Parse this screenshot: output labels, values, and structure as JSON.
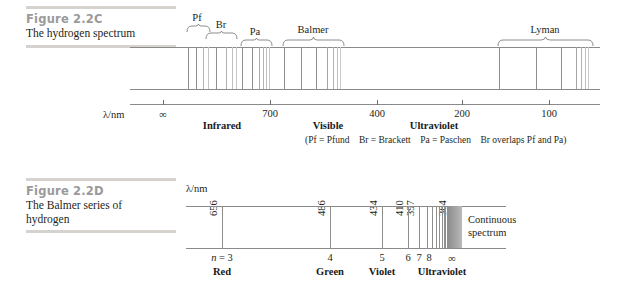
{
  "figure_c": {
    "label": "Figure 2.2C",
    "title": "The hydrogen spectrum",
    "axis_label": "λ/nm",
    "tick_labels": [
      "∞",
      "700",
      "400",
      "200",
      "100"
    ],
    "tick_values": [
      null,
      700,
      400,
      200,
      100
    ],
    "region_labels": [
      "Infrared",
      "Visible",
      "Ultraviolet"
    ],
    "series_labels": [
      "Pf",
      "Br",
      "Pa",
      "Balmer",
      "Lyman"
    ],
    "note": "(Pf = Pfund Br = Brackett Pa = Paschen Br overlaps Pf and Pa)",
    "note_parts": [
      "(Pf = Pfund",
      "Br = Brackett",
      "Pa = Paschen",
      "Br overlaps Pf and Pa)"
    ]
  },
  "figure_d": {
    "label": "Figure 2.2D",
    "title_line1": "The Balmer series of",
    "title_line2": "hydrogen",
    "axis_label": "λ/nm",
    "wavelength_labels": [
      "656",
      "486",
      "434",
      "410",
      "397",
      "364"
    ],
    "n_labels": [
      "n = 3",
      "4",
      "5",
      "6",
      "7",
      "8",
      "∞"
    ],
    "color_labels": [
      "Red",
      "Green",
      "Violet",
      "Ultraviolet"
    ],
    "continuous_line1": "Continuous",
    "continuous_line2": "spectrum"
  },
  "chart_data": {
    "type": "line",
    "panels": [
      {
        "id": "figure_2_2C",
        "title": "The hydrogen spectrum",
        "xlabel": "λ/nm",
        "xticks": [
          "∞",
          "700",
          "400",
          "200",
          "100"
        ],
        "xtick_px": [
          163,
          270,
          377,
          462,
          549
        ],
        "grid": false,
        "regions": [
          {
            "name": "Infrared",
            "center_px": 222
          },
          {
            "name": "Visible",
            "center_px": 328
          },
          {
            "name": "Ultraviolet",
            "center_px": 432
          }
        ],
        "series": [
          {
            "name": "Pf",
            "brace_px": [
              186,
              210
            ],
            "lines_px": [
              188,
              196,
              203,
              208
            ]
          },
          {
            "name": "Br",
            "brace_px": [
              205,
              237
            ],
            "lines_px": [
              207,
              216,
              226,
              232,
              236
            ]
          },
          {
            "name": "Pa",
            "brace_px": [
              240,
              272
            ],
            "lines_px": [
              242,
              250,
              258,
              263,
              266,
              269,
              271
            ]
          },
          {
            "name": "Balmer",
            "brace_px": [
              282,
              344
            ],
            "lines_px": [
              284,
              301,
              316,
              327,
              333,
              337,
              340,
              342
            ]
          },
          {
            "name": "Lyman",
            "brace_px": [
              497,
              593
            ],
            "lines_px": [
              499,
              536,
              561,
              576,
              581,
              585,
              588,
              590
            ]
          }
        ]
      },
      {
        "id": "figure_2_2D",
        "title": "The Balmer series of hydrogen",
        "xlabel": "λ/nm",
        "grid": false,
        "lines": [
          {
            "wavelength_nm": 656,
            "n": 3,
            "color_region": "Red",
            "px": 222
          },
          {
            "wavelength_nm": 486,
            "n": 4,
            "color_region": "Green",
            "px": 330
          },
          {
            "wavelength_nm": 434,
            "n": 5,
            "color_region": "Violet",
            "px": 382
          },
          {
            "wavelength_nm": 410,
            "n": 6,
            "color_region": "Ultraviolet",
            "px": 408
          },
          {
            "wavelength_nm": 397,
            "n": 7,
            "color_region": "Ultraviolet",
            "px": 419
          },
          {
            "wavelength_nm": 389,
            "n": 8,
            "color_region": "Ultraviolet",
            "px": 427
          },
          {
            "wavelength_nm": 364,
            "n": null,
            "color_region": "Ultraviolet",
            "px": 448
          }
        ],
        "series_limit": {
          "label": "∞",
          "px": 452
        },
        "continuous_spectrum": {
          "from_px": 448,
          "to_px": 462
        }
      }
    ]
  },
  "colors": {
    "fig_label": "#9a9a9a",
    "rule": "#d6d2cd",
    "line": "#8e8e8e",
    "text": "#231f20"
  }
}
